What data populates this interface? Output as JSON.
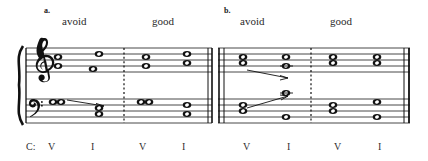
{
  "figure": {
    "type": "music-notation-example",
    "key_label": "C:",
    "examples": [
      {
        "id": "a",
        "marker": "a.",
        "annotations": [
          {
            "text": "avoid",
            "x": 86,
            "y": 24
          },
          {
            "text": "good",
            "x": 172,
            "y": 24
          }
        ],
        "roman_numerals": [
          {
            "text": "V",
            "x": 51,
            "y": 148
          },
          {
            "text": "I",
            "x": 92,
            "y": 148
          },
          {
            "text": "V",
            "x": 142,
            "y": 148
          },
          {
            "text": "I",
            "x": 183,
            "y": 148
          }
        ],
        "chords": [
          {
            "label": "V",
            "quality": "dominant",
            "treble_notes": [
              "B4",
              "D5"
            ],
            "bass_notes": [
              "G2",
              "G2"
            ],
            "voice_leading_line": true
          },
          {
            "label": "I",
            "quality": "tonic-doubled-third",
            "treble_notes": [
              "G4",
              "E5"
            ],
            "bass_notes": [
              "C3",
              "E3"
            ],
            "voice_leading_line": false
          },
          {
            "label": "V",
            "quality": "dominant",
            "treble_notes": [
              "B4",
              "D5"
            ],
            "bass_notes": [
              "G2",
              "G2"
            ],
            "voice_leading_line": false
          },
          {
            "label": "I",
            "quality": "tonic",
            "treble_notes": [
              "C5",
              "E5"
            ],
            "bass_notes": [
              "C3",
              "G3"
            ],
            "voice_leading_line": false
          }
        ]
      },
      {
        "id": "b",
        "marker": "b.",
        "annotations": [
          {
            "text": "avoid",
            "x": 264,
            "y": 24
          },
          {
            "text": "good",
            "x": 352,
            "y": 24
          }
        ],
        "roman_numerals": [
          {
            "text": "V",
            "x": 246,
            "y": 148
          },
          {
            "text": "I",
            "x": 288,
            "y": 148
          },
          {
            "text": "V",
            "x": 337,
            "y": 148
          },
          {
            "text": "I",
            "x": 379,
            "y": 148
          }
        ],
        "chords": [
          {
            "label": "V",
            "quality": "dominant",
            "treble_notes": [
              "B4",
              "D5"
            ],
            "bass_notes": [
              "G2",
              "B2"
            ],
            "voice_leading_line": true
          },
          {
            "label": "I",
            "quality": "tonic-leap",
            "treble_notes": [
              "C5",
              "D5"
            ],
            "bass_notes": [
              "C4-ledger",
              "E3"
            ],
            "voice_leading_line": false
          },
          {
            "label": "V",
            "quality": "dominant",
            "treble_notes": [
              "B4",
              "D5"
            ],
            "bass_notes": [
              "G2",
              "B2"
            ],
            "voice_leading_line": false
          },
          {
            "label": "I",
            "quality": "tonic",
            "treble_notes": [
              "C5",
              "E5"
            ],
            "bass_notes": [
              "E3",
              "G3"
            ],
            "voice_leading_line": false
          }
        ]
      }
    ],
    "staff": {
      "clefs": [
        "treble",
        "bass"
      ],
      "barline_style_middle": "dotted",
      "barline_style_end": "double"
    },
    "colors": {
      "ink": "#111111",
      "text": "#2a2a2a",
      "stafflines": "#1a1a1a"
    }
  }
}
